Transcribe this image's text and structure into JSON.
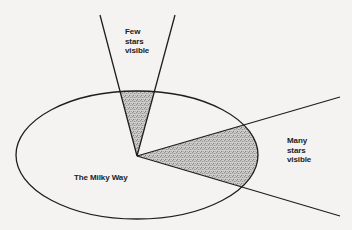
{
  "diagram": {
    "labels": {
      "few_stars": [
        "Few",
        "stars",
        "visible"
      ],
      "many_stars": [
        "Many",
        "stars",
        "visible"
      ],
      "galaxy": "The Milky Way"
    },
    "colors": {
      "stroke": "#1e1e1e",
      "background": "#f4f3f1",
      "stipple": "#555555",
      "stipple_bg": "#cfcdc9",
      "faded_text": "#d9d7d3"
    },
    "geometry": {
      "observer": [
        137,
        156
      ],
      "ellipse": {
        "cx": 137,
        "cy": 155,
        "rx": 121,
        "ry": 64
      },
      "upper_cone": {
        "left_end": [
          100,
          15
        ],
        "right_end": [
          175,
          15
        ]
      },
      "side_cone": {
        "upper_end": [
          340,
          97
        ],
        "lower_end": [
          340,
          216
        ]
      }
    }
  }
}
